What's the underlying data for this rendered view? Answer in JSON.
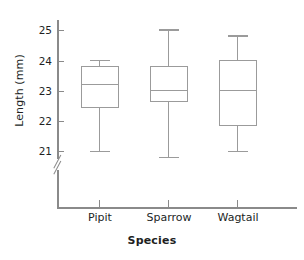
{
  "chart_data": {
    "type": "box",
    "title": "",
    "xlabel": "Species",
    "ylabel": "Length (mm)",
    "categories": [
      "Pipit",
      "Sparrow",
      "Wagtail"
    ],
    "ylim": [
      20.6,
      25.3
    ],
    "yticks": [
      21,
      22,
      23,
      24,
      25
    ],
    "ytick_labels": [
      "21",
      "22",
      "23",
      "24",
      "25"
    ],
    "y_axis_break": true,
    "grid": false,
    "legend": null,
    "boxes": [
      {
        "category": "Pipit",
        "min": 21.05,
        "q1": 22.45,
        "median": 23.25,
        "q3": 23.85,
        "max": 24.05
      },
      {
        "category": "Sparrow",
        "min": 20.85,
        "q1": 22.65,
        "median": 23.05,
        "q3": 23.85,
        "max": 25.05
      },
      {
        "category": "Wagtail",
        "min": 21.05,
        "q1": 21.85,
        "median": 23.05,
        "q3": 24.05,
        "max": 24.85
      }
    ]
  },
  "axes": {
    "y_title": "Length (mm)",
    "x_title": "Species",
    "y_tick_labels": [
      "25",
      "24",
      "23",
      "22",
      "21"
    ],
    "x_tick_labels": [
      "Pipit",
      "Sparrow",
      "Wagtail"
    ]
  },
  "colors": {
    "line": "#9b9b9b",
    "axis": "#8a8a8a",
    "text": "#221f1f",
    "background": "#ffffff"
  }
}
